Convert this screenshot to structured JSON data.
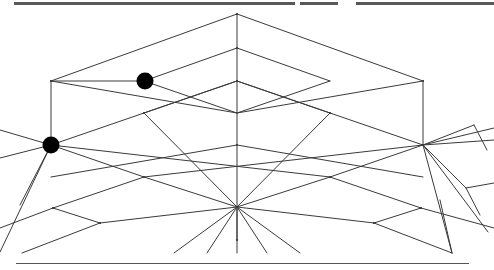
{
  "figure": {
    "caption": "",
    "width": 494,
    "height": 270,
    "background_color": "#ffffff",
    "line_color": "#3a3a3a",
    "node_color": "#000000",
    "scan_bar_color": "#585858",
    "rule_color": "#555555"
  },
  "chart_data": {
    "type": "line",
    "xlabel": "",
    "ylabel": "",
    "xlim": [
      0,
      494
    ],
    "ylim": [
      0,
      270
    ],
    "grid": false,
    "legend": "none",
    "annotations": [
      "black filled node marker upper-left on lattice edge",
      "black filled node marker left vertex hub",
      "scanned page artifact bars along top edge",
      "horizontal rule near bottom edge"
    ],
    "nodes": [
      {
        "name": "apex-top",
        "x": 237,
        "y": 14,
        "marker": false
      },
      {
        "name": "ridge-upper-mid",
        "x": 237,
        "y": 48,
        "marker": false
      },
      {
        "name": "center-hub",
        "x": 237,
        "y": 81,
        "marker": false
      },
      {
        "name": "center-mid",
        "x": 237,
        "y": 145,
        "marker": false
      },
      {
        "name": "bottom-hub",
        "x": 237,
        "y": 207,
        "marker": false
      },
      {
        "name": "bottom-tail",
        "x": 237,
        "y": 240,
        "marker": false
      },
      {
        "name": "left-post-top",
        "x": 51,
        "y": 81,
        "marker": false
      },
      {
        "name": "left-vertex-hub",
        "x": 51,
        "y": 145,
        "marker": true
      },
      {
        "name": "right-post-top",
        "x": 423,
        "y": 81,
        "marker": false
      },
      {
        "name": "right-vertex-hub",
        "x": 423,
        "y": 145,
        "marker": false
      },
      {
        "name": "upper-left-edge-node",
        "x": 145,
        "y": 81,
        "marker": true
      },
      {
        "name": "left-inner-cross",
        "x": 144,
        "y": 113,
        "marker": false
      },
      {
        "name": "right-inner-cross",
        "x": 330,
        "y": 113,
        "marker": false
      },
      {
        "name": "left-lower-cross",
        "x": 144,
        "y": 177,
        "marker": false
      },
      {
        "name": "right-lower-cross",
        "x": 330,
        "y": 177,
        "marker": false
      },
      {
        "name": "left-lower-vertex",
        "x": 53,
        "y": 208,
        "marker": false
      },
      {
        "name": "right-lower-vertex",
        "x": 421,
        "y": 208,
        "marker": false
      },
      {
        "name": "left-foot-node",
        "x": 100,
        "y": 223,
        "marker": false
      },
      {
        "name": "right-foot-node",
        "x": 374,
        "y": 223,
        "marker": false
      }
    ],
    "series": [
      {
        "name": "upper-roof-ridges",
        "values": [
          [
            [
              237,
              14
            ],
            [
              51,
              81
            ]
          ],
          [
            [
              237,
              14
            ],
            [
              423,
              81
            ]
          ],
          [
            [
              237,
              48
            ],
            [
              144,
              81
            ]
          ],
          [
            [
              237,
              48
            ],
            [
              330,
              81
            ]
          ],
          [
            [
              237,
              81
            ],
            [
              144,
              113
            ]
          ],
          [
            [
              237,
              81
            ],
            [
              330,
              113
            ]
          ]
        ]
      },
      {
        "name": "upper-box-horizontals",
        "values": [
          [
            [
              51,
              81
            ],
            [
              237,
              113
            ]
          ],
          [
            [
              237,
              113
            ],
            [
              423,
              81
            ]
          ],
          [
            [
              144,
              81
            ],
            [
              237,
              113
            ]
          ],
          [
            [
              237,
              113
            ],
            [
              330,
              81
            ]
          ],
          [
            [
              51,
              81
            ],
            [
              145,
              81
            ]
          ]
        ]
      },
      {
        "name": "vertical-posts",
        "values": [
          [
            [
              51,
              81
            ],
            [
              51,
              145
            ]
          ],
          [
            [
              423,
              81
            ],
            [
              423,
              145
            ]
          ],
          [
            [
              237,
              14
            ],
            [
              237,
              240
            ]
          ]
        ]
      },
      {
        "name": "mid-lattice-diagonals",
        "values": [
          [
            [
              51,
              145
            ],
            [
              237,
              81
            ]
          ],
          [
            [
              423,
              145
            ],
            [
              237,
              81
            ]
          ],
          [
            [
              51,
              145
            ],
            [
              330,
              177
            ]
          ],
          [
            [
              423,
              145
            ],
            [
              144,
              177
            ]
          ],
          [
            [
              144,
              113
            ],
            [
              237,
              207
            ]
          ],
          [
            [
              330,
              113
            ],
            [
              237,
              207
            ]
          ],
          [
            [
              237,
              145
            ],
            [
              51,
              177
            ]
          ],
          [
            [
              237,
              145
            ],
            [
              423,
              177
            ]
          ]
        ]
      },
      {
        "name": "lower-lattice",
        "values": [
          [
            [
              51,
              145
            ],
            [
              144,
              177
            ]
          ],
          [
            [
              423,
              145
            ],
            [
              330,
              177
            ]
          ],
          [
            [
              144,
              177
            ],
            [
              237,
              207
            ]
          ],
          [
            [
              330,
              177
            ],
            [
              237,
              207
            ]
          ],
          [
            [
              144,
              177
            ],
            [
              53,
              208
            ]
          ],
          [
            [
              330,
              177
            ],
            [
              421,
              208
            ]
          ],
          [
            [
              53,
              208
            ],
            [
              100,
              223
            ]
          ],
          [
            [
              421,
              208
            ],
            [
              374,
              223
            ]
          ],
          [
            [
              100,
              223
            ],
            [
              237,
              207
            ]
          ],
          [
            [
              374,
              223
            ],
            [
              237,
              207
            ]
          ]
        ]
      },
      {
        "name": "left-hub-rays",
        "values": [
          [
            [
              51,
              145
            ],
            [
              0,
              130
            ]
          ],
          [
            [
              51,
              145
            ],
            [
              0,
              158
            ]
          ],
          [
            [
              51,
              145
            ],
            [
              20,
              205
            ]
          ],
          [
            [
              51,
              145
            ],
            [
              0,
              252
            ]
          ]
        ]
      },
      {
        "name": "right-hub-rays",
        "values": [
          [
            [
              423,
              145
            ],
            [
              494,
              128
            ]
          ],
          [
            [
              423,
              145
            ],
            [
              494,
              140
            ]
          ],
          [
            [
              423,
              145
            ],
            [
              474,
              125
            ]
          ],
          [
            [
              423,
              145
            ],
            [
              466,
              188
            ]
          ],
          [
            [
              423,
              145
            ],
            [
              488,
              232
            ]
          ],
          [
            [
              423,
              145
            ],
            [
              452,
              253
            ]
          ]
        ]
      },
      {
        "name": "right-outer-branches",
        "values": [
          [
            [
              474,
              125
            ],
            [
              487,
              150
            ]
          ],
          [
            [
              466,
              188
            ],
            [
              494,
              183
            ]
          ],
          [
            [
              466,
              188
            ],
            [
              480,
              215
            ]
          ],
          [
            [
              452,
              253
            ],
            [
              440,
              200
            ]
          ]
        ]
      },
      {
        "name": "bottom-fan",
        "values": [
          [
            [
              237,
              207
            ],
            [
              174,
              253
            ]
          ],
          [
            [
              237,
              207
            ],
            [
              207,
              253
            ]
          ],
          [
            [
              237,
              207
            ],
            [
              237,
              253
            ]
          ],
          [
            [
              237,
              207
            ],
            [
              267,
              253
            ]
          ],
          [
            [
              237,
              207
            ],
            [
              300,
              253
            ]
          ]
        ]
      },
      {
        "name": "bottom-outer-edges",
        "values": [
          [
            [
              53,
              208
            ],
            [
              0,
              228
            ]
          ],
          [
            [
              421,
              208
            ],
            [
              494,
              228
            ]
          ],
          [
            [
              100,
              223
            ],
            [
              22,
              253
            ]
          ],
          [
            [
              374,
              223
            ],
            [
              452,
              253
            ]
          ]
        ]
      }
    ]
  },
  "artifacts": {
    "scan_bars": [
      {
        "name": "scan-bar-left",
        "x": 14,
        "y": 2,
        "width": 281,
        "height": 3
      },
      {
        "name": "scan-bar-middle",
        "x": 300,
        "y": 2,
        "width": 38,
        "height": 3
      },
      {
        "name": "scan-bar-right",
        "x": 356,
        "y": 2,
        "width": 138,
        "height": 3
      }
    ],
    "bottom_rule": {
      "name": "bottom-rule",
      "x": 16,
      "y": 263,
      "width": 453,
      "height": 1
    }
  }
}
